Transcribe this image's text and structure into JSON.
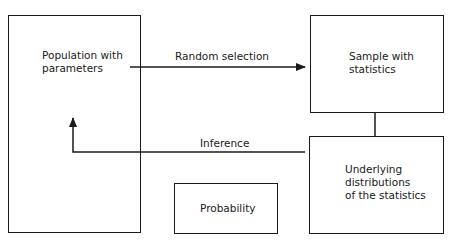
{
  "diagram": {
    "nodes": {
      "population": {
        "label": "Population with\nparameters"
      },
      "sample": {
        "label": "Sample with\nstatistics"
      },
      "distributions": {
        "label": "Underlying\ndistributions\nof the statistics"
      },
      "probability": {
        "label": "Probability"
      }
    },
    "edges": {
      "random_selection": {
        "label": "Random selection",
        "from": "population",
        "to": "sample"
      },
      "inference": {
        "label": "Inference",
        "from": "distributions",
        "to": "population"
      },
      "link": {
        "from": "sample",
        "to": "distributions"
      }
    },
    "colors": {
      "stroke": "#1a1a1a",
      "background": "#ffffff"
    }
  }
}
